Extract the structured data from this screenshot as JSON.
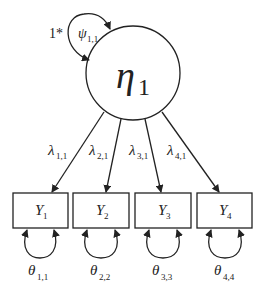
{
  "diagram": {
    "type": "structural-equation-model",
    "latent": {
      "symbol": "η",
      "subscript": "1",
      "variance": {
        "symbol": "ψ",
        "subscript": "1,1",
        "fixed_label": "1*"
      }
    },
    "indicators": [
      {
        "symbol": "Y",
        "subscript": "1",
        "loading": {
          "symbol": "λ",
          "subscript": "1,1"
        },
        "residual": {
          "symbol": "θ",
          "subscript": "1,1"
        }
      },
      {
        "symbol": "Y",
        "subscript": "2",
        "loading": {
          "symbol": "λ",
          "subscript": "2,1"
        },
        "residual": {
          "symbol": "θ",
          "subscript": "2,2"
        }
      },
      {
        "symbol": "Y",
        "subscript": "3",
        "loading": {
          "symbol": "λ",
          "subscript": "3,1"
        },
        "residual": {
          "symbol": "θ",
          "subscript": "3,3"
        }
      },
      {
        "symbol": "Y",
        "subscript": "4",
        "loading": {
          "symbol": "λ",
          "subscript": "4,1"
        },
        "residual": {
          "symbol": "θ",
          "subscript": "4,4"
        }
      }
    ],
    "colors": {
      "stroke": "#222222",
      "background": "#ffffff"
    }
  }
}
